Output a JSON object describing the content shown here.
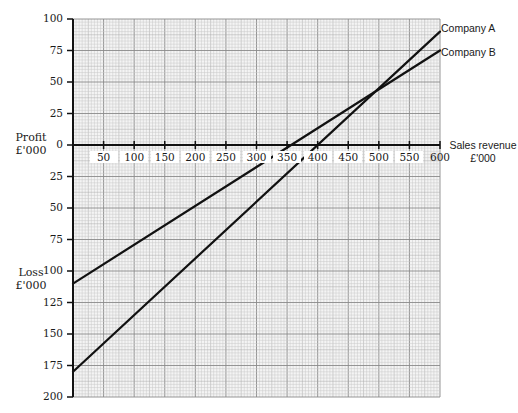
{
  "chart_data": {
    "type": "line",
    "title": "",
    "xlabel": "Sales revenue £'000",
    "ylabel_top": "Profit £'000",
    "ylabel_bottom": "Loss £'000",
    "xlim": [
      0,
      600
    ],
    "ylim": [
      -200,
      100
    ],
    "grid": true,
    "x_ticks": [
      50,
      100,
      150,
      200,
      250,
      300,
      350,
      400,
      450,
      500,
      550,
      600
    ],
    "x_tick_labels": [
      "50",
      "100",
      "150",
      "200",
      "250",
      "300",
      "350",
      "400",
      "450",
      "500",
      "550",
      "600"
    ],
    "y_ticks": [
      100,
      75,
      50,
      25,
      0,
      -25,
      -50,
      -75,
      -100,
      -125,
      -150,
      -175,
      -200
    ],
    "y_tick_labels": [
      "100",
      "75",
      "50",
      "25",
      "0",
      "25",
      "50",
      "75",
      "100",
      "125",
      "150",
      "175",
      "200"
    ],
    "series": [
      {
        "name": "Company A",
        "x": [
          0,
          600
        ],
        "values": [
          -180,
          90
        ],
        "color": "#111111"
      },
      {
        "name": "Company B",
        "x": [
          0,
          600
        ],
        "values": [
          -110,
          75
        ],
        "color": "#111111"
      }
    ],
    "annotations": {
      "company_a_breakeven": 400,
      "company_b_breakeven": 357,
      "intersection": [
        494,
        42
      ]
    },
    "legend_position": "inline-right"
  },
  "labels": {
    "profit_line1": "Profit",
    "profit_line2": "£'000",
    "loss_line1": "Loss",
    "loss_line2": "£'000",
    "x_line1": "Sales revenue",
    "x_line2": "£'000",
    "company_a": "Company A",
    "company_b": "Company B"
  },
  "colors": {
    "grid_minor": "#c8c8c8",
    "grid_major": "#8a8a8a",
    "axis": "#111111",
    "line": "#111111"
  }
}
